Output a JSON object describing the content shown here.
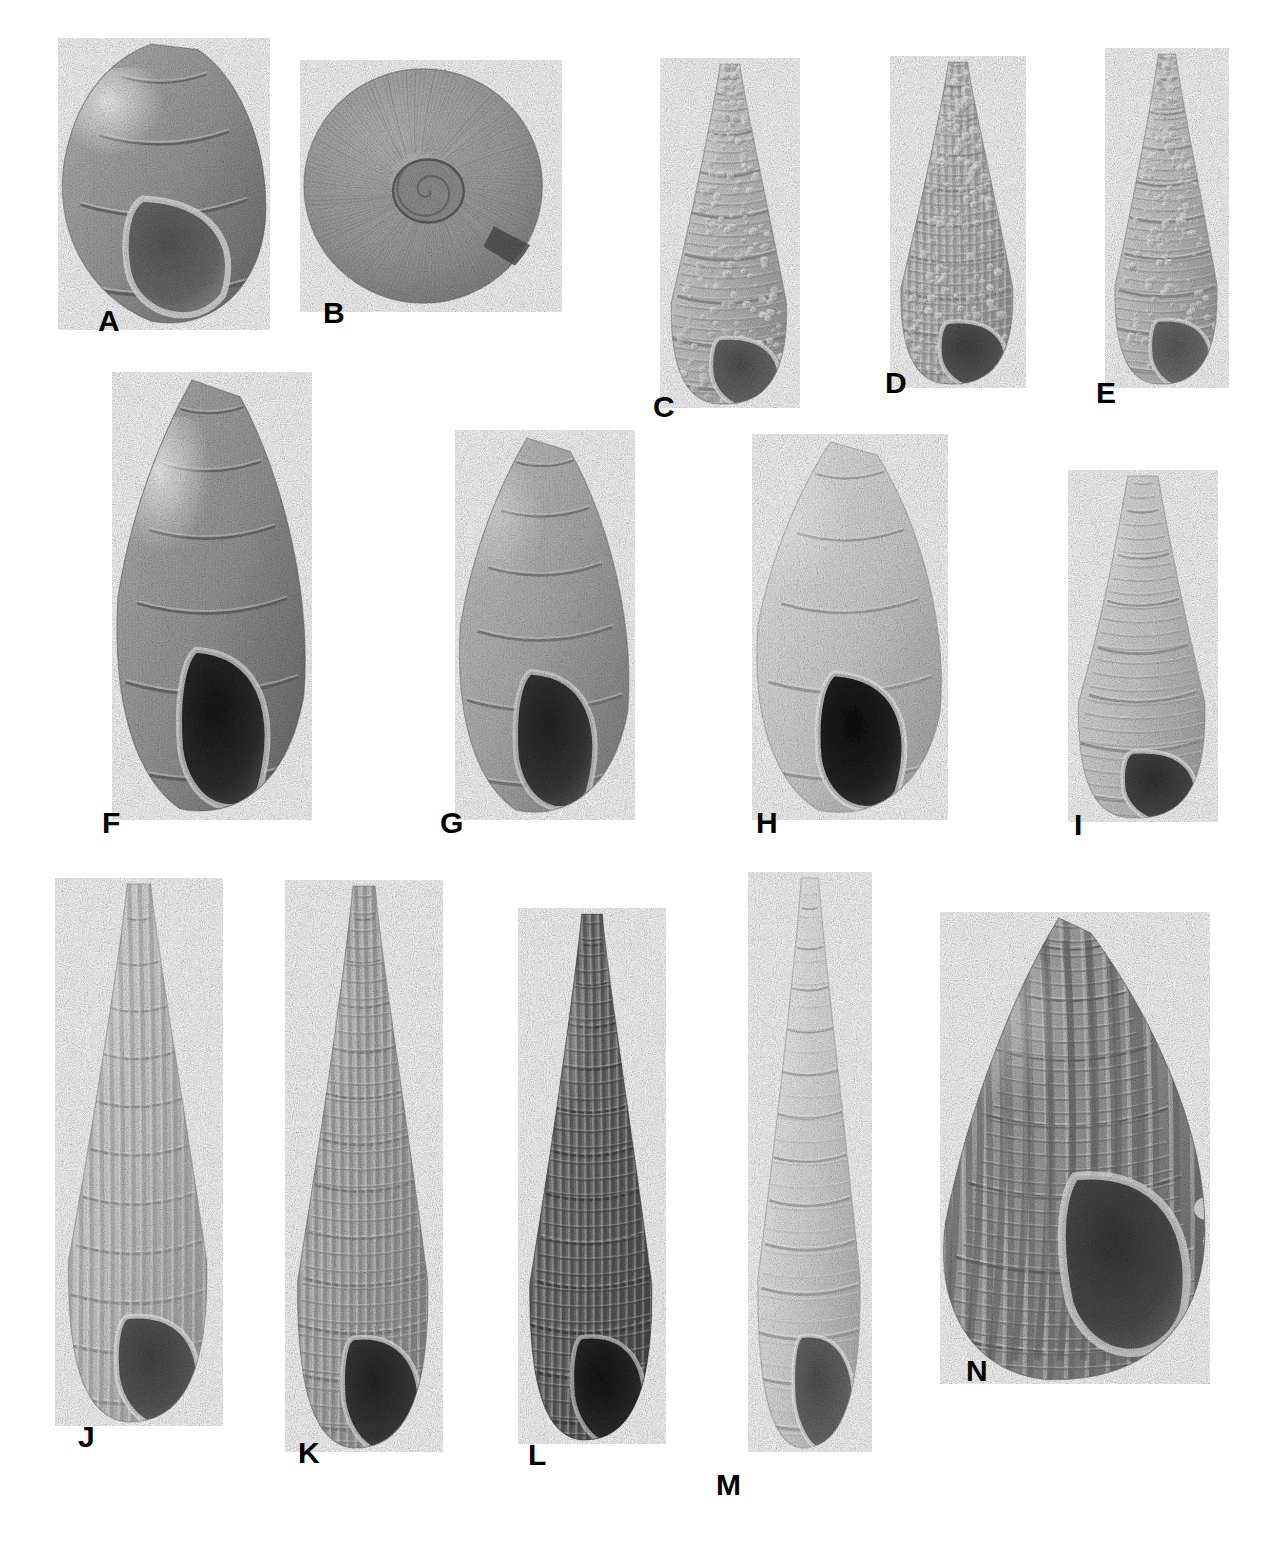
{
  "plate": {
    "kind": "photographic-plate",
    "medium": "black-and-white photograph",
    "background_color": "#ffffff",
    "label_color": "#000000",
    "width": 1281,
    "height": 1556,
    "rows": 3,
    "figure_count": 14
  },
  "figures": [
    {
      "label": "A",
      "label_x": 98,
      "label_y": 306,
      "x": 58,
      "y": 38,
      "w": 212,
      "h": 292,
      "shape": "globose",
      "sculpture": "smooth",
      "tone": "#9d9d9d",
      "aperture_tone": "#6f6f6f",
      "highlight_tone": "#f2f2f2",
      "whorls": 4,
      "orientation": "apertural-view",
      "row": 1
    },
    {
      "label": "B",
      "label_x": 323,
      "label_y": 298,
      "x": 300,
      "y": 60,
      "w": 262,
      "h": 252,
      "shape": "planispiral-disc",
      "sculpture": "fine-growth-lines",
      "tone": "#a5a5a5",
      "aperture_tone": "#5e5e5e",
      "highlight_tone": "#dcdcdc",
      "whorls": 4,
      "orientation": "umbilical-view",
      "row": 1
    },
    {
      "label": "C",
      "label_x": 653,
      "label_y": 392,
      "x": 660,
      "y": 58,
      "w": 140,
      "h": 350,
      "shape": "turriculate",
      "sculpture": "nodulose",
      "tone": "#c4c4c4",
      "aperture_tone": "#6a6a6a",
      "highlight_tone": "#efefef",
      "whorls": 8,
      "orientation": "apertural-view",
      "row": 1
    },
    {
      "label": "D",
      "label_x": 885,
      "label_y": 368,
      "x": 890,
      "y": 56,
      "w": 136,
      "h": 332,
      "shape": "turriculate",
      "sculpture": "beaded-cancellate",
      "tone": "#c0c0c0",
      "aperture_tone": "#5a5a5a",
      "highlight_tone": "#f0f0f0",
      "whorls": 9,
      "orientation": "apertural-view",
      "row": 1
    },
    {
      "label": "E",
      "label_x": 1096,
      "label_y": 378,
      "x": 1105,
      "y": 48,
      "w": 124,
      "h": 340,
      "shape": "turriculate",
      "sculpture": "nodulose",
      "tone": "#c6c6c6",
      "aperture_tone": "#727272",
      "highlight_tone": "#efefef",
      "whorls": 9,
      "orientation": "apertural-view",
      "row": 1
    },
    {
      "label": "F",
      "label_x": 102,
      "label_y": 808,
      "x": 112,
      "y": 372,
      "w": 200,
      "h": 448,
      "shape": "elongate-ovate",
      "sculpture": "smooth-glossy",
      "tone": "#9b9b9b",
      "aperture_tone": "#2e2e2e",
      "highlight_tone": "#e8e8e8",
      "whorls": 6,
      "orientation": "apertural-view",
      "row": 2
    },
    {
      "label": "G",
      "label_x": 440,
      "label_y": 808,
      "x": 455,
      "y": 430,
      "w": 180,
      "h": 390,
      "shape": "elongate-ovate",
      "sculpture": "smooth",
      "tone": "#b0b0b0",
      "aperture_tone": "#3a3a3a",
      "highlight_tone": "#e6e6e6",
      "whorls": 6,
      "orientation": "apertural-view",
      "row": 2
    },
    {
      "label": "H",
      "label_x": 756,
      "label_y": 808,
      "x": 752,
      "y": 434,
      "w": 196,
      "h": 386,
      "shape": "ovate",
      "sculpture": "smooth",
      "tone": "#d5d5d5",
      "aperture_tone": "#262626",
      "highlight_tone": "#f4f4f4",
      "whorls": 5,
      "orientation": "apertural-view",
      "row": 2
    },
    {
      "label": "I",
      "label_x": 1074,
      "label_y": 810,
      "x": 1068,
      "y": 470,
      "w": 150,
      "h": 352,
      "shape": "elongate-conic",
      "sculpture": "spiral-corded",
      "tone": "#cfcfcf",
      "aperture_tone": "#4a4a4a",
      "highlight_tone": "#f2f2f2",
      "whorls": 7,
      "orientation": "apertural-view",
      "row": 2
    },
    {
      "label": "J",
      "label_x": 78,
      "label_y": 1422,
      "x": 55,
      "y": 878,
      "w": 168,
      "h": 548,
      "shape": "slender-turriculate",
      "sculpture": "axial-ribbed",
      "tone": "#cdcdcd",
      "aperture_tone": "#5c5c5c",
      "highlight_tone": "#f4f4f4",
      "whorls": 11,
      "orientation": "apertural-view",
      "row": 3
    },
    {
      "label": "K",
      "label_x": 298,
      "label_y": 1438,
      "x": 285,
      "y": 880,
      "w": 158,
      "h": 572,
      "shape": "slender-turriculate",
      "sculpture": "cancellate",
      "tone": "#b4b4b4",
      "aperture_tone": "#3c3c3c",
      "highlight_tone": "#ececec",
      "whorls": 12,
      "orientation": "apertural-view",
      "row": 3
    },
    {
      "label": "L",
      "label_x": 528,
      "label_y": 1440,
      "x": 518,
      "y": 908,
      "w": 148,
      "h": 536,
      "shape": "slender-turriculate",
      "sculpture": "cancellate-dark",
      "tone": "#737373",
      "aperture_tone": "#2b2b2b",
      "highlight_tone": "#d2d2d2",
      "whorls": 12,
      "orientation": "apertural-view",
      "row": 3
    },
    {
      "label": "M",
      "label_x": 716,
      "label_y": 1470,
      "x": 748,
      "y": 872,
      "w": 124,
      "h": 580,
      "shape": "slender-turriculate",
      "sculpture": "smooth-spiral",
      "tone": "#dedede",
      "aperture_tone": "#6a6a6a",
      "highlight_tone": "#fafafa",
      "whorls": 13,
      "orientation": "apertural-view",
      "row": 3
    },
    {
      "label": "N",
      "label_x": 966,
      "label_y": 1356,
      "x": 940,
      "y": 912,
      "w": 270,
      "h": 472,
      "shape": "trochiform-fusiform",
      "sculpture": "coarsely-cancellate-varicose",
      "tone": "#9a9a9a",
      "aperture_tone": "#4e4e4e",
      "highlight_tone": "#ededed",
      "whorls": 7,
      "orientation": "apertural-view",
      "row": 3
    }
  ]
}
